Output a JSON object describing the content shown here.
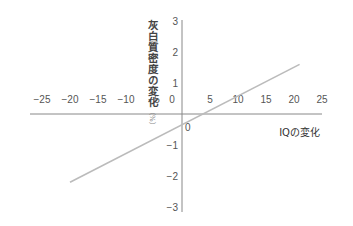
{
  "chart_data": {
    "type": "line",
    "title": "",
    "xlabel": "IQの変化",
    "ylabel": "灰白質密度の変化",
    "ylabel_unit": "（%）",
    "xlim": [
      -25,
      25
    ],
    "ylim": [
      -3,
      3
    ],
    "x_ticks": [
      -25,
      -20,
      -15,
      -10,
      -5,
      0,
      5,
      10,
      15,
      20,
      25
    ],
    "y_ticks": [
      3,
      2,
      1,
      0,
      -1,
      -2,
      -3
    ],
    "x_tick_labels": [
      "−25",
      "−20",
      "−15",
      "−10",
      "−5",
      "0",
      "5",
      "10",
      "15",
      "20",
      "25"
    ],
    "y_tick_labels": [
      "3",
      "2",
      "1",
      "−1",
      "−2",
      "−3"
    ],
    "origin_label": "0",
    "grid": false,
    "legend": null,
    "series": [
      {
        "name": "regression line",
        "color": "#bbbbbb",
        "x": [
          -20,
          21
        ],
        "y": [
          -2.2,
          1.6
        ]
      }
    ]
  },
  "colors": {
    "axis": "#888888",
    "line": "#bbbbbb",
    "background": "#ffffff"
  }
}
